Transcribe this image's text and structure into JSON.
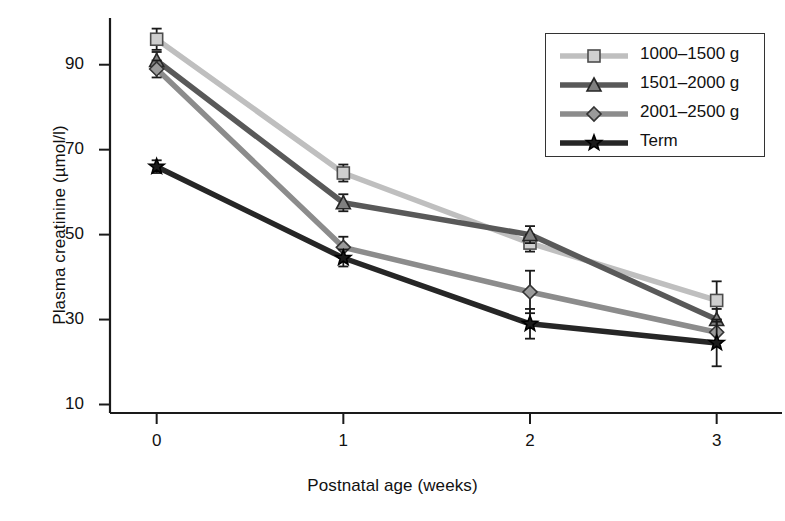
{
  "chart_data": {
    "type": "line",
    "title": "",
    "xlabel": "Postnatal age (weeks)",
    "ylabel": "Plasma creatinine (µmol/l)",
    "x": [
      0,
      1,
      2,
      3
    ],
    "xtick_labels": [
      "0",
      "1",
      "2",
      "3"
    ],
    "ytick_labels": [
      "10",
      "30",
      "50",
      "70",
      "90"
    ],
    "yticks": [
      10,
      30,
      50,
      70,
      90
    ],
    "xlim": [
      -0.25,
      3.35
    ],
    "ylim": [
      8,
      101
    ],
    "grid": false,
    "legend_position": "top-right",
    "series": [
      {
        "name": "1000–1500 g",
        "marker": "square",
        "color": "#bfbfbf",
        "marker_fill": "#cfcfcf",
        "marker_edge": "#4d4d4d",
        "values": [
          96,
          64.5,
          48,
          34.5
        ],
        "err_low": [
          2.5,
          2.0,
          2.0,
          4.5
        ],
        "err_high": [
          2.5,
          2.0,
          2.0,
          4.5
        ]
      },
      {
        "name": "1501–2000 g",
        "marker": "triangle",
        "color": "#595959",
        "marker_fill": "#808080",
        "marker_edge": "#262626",
        "values": [
          91,
          57.5,
          50,
          30
        ],
        "err_low": [
          2.0,
          2.0,
          2.0,
          2.5
        ],
        "err_high": [
          2.0,
          2.0,
          2.0,
          2.5
        ]
      },
      {
        "name": "2001–2500 g",
        "marker": "diamond",
        "color": "#8c8c8c",
        "marker_fill": "#9a9a9a",
        "marker_edge": "#333333",
        "values": [
          89,
          47,
          36.5,
          27
        ],
        "err_low": [
          2.0,
          2.5,
          5.0,
          2.5
        ],
        "err_high": [
          2.0,
          2.5,
          5.0,
          2.5
        ]
      },
      {
        "name": "Term",
        "marker": "star",
        "color": "#262626",
        "marker_fill": "#1a1a1a",
        "marker_edge": "#000000",
        "values": [
          66,
          44.5,
          29,
          24.5
        ],
        "err_low": [
          1.5,
          2.0,
          3.5,
          5.5
        ],
        "err_high": [
          1.5,
          2.0,
          3.5,
          5.5
        ]
      }
    ]
  },
  "legend": {
    "entries": [
      {
        "label": "1000–1500 g"
      },
      {
        "label": "1501–2000 g"
      },
      {
        "label": "2001–2500 g"
      },
      {
        "label": "Term"
      }
    ]
  }
}
